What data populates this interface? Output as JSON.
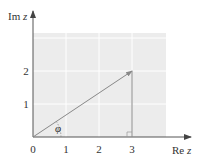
{
  "diagram": {
    "axes": {
      "x_label": "Re",
      "x_label_var": "z",
      "y_label": "Im",
      "y_label_var": "z",
      "x_ticks": [
        "0",
        "1",
        "2",
        "3"
      ],
      "y_ticks": [
        "1",
        "2"
      ],
      "x_range": [
        0,
        4
      ],
      "y_range": [
        0,
        3
      ]
    },
    "point": {
      "re": 3,
      "im": 2
    },
    "angle_label": "φ",
    "colors": {
      "background_grid": "#ececec",
      "grid_lines": "#ffffff",
      "axis": "#555555",
      "vector": "#888888",
      "text": "#333333"
    }
  }
}
